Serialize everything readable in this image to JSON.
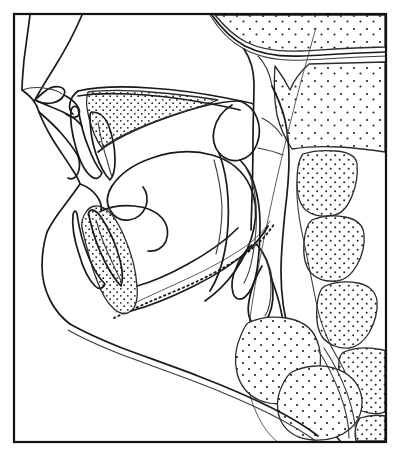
{
  "figure": {
    "title": "Lateral cephalometric tracing",
    "width_px": 397,
    "height_px": 459,
    "background_color": "#ffffff",
    "line_color": "#1a1a1a",
    "stipple_color": "#222222",
    "frame": {
      "visible": true,
      "x": 14,
      "y": 14,
      "width": 372,
      "height": 428,
      "stroke_color": "#111111",
      "stroke_width": 2.2
    },
    "labels": [],
    "annotations": [],
    "structures": [
      {
        "name": "soft-tissue-profile",
        "kind": "outline",
        "stipple": false
      },
      {
        "name": "forehead-glabella",
        "kind": "outline",
        "stipple": false
      },
      {
        "name": "nasal-dorsum",
        "kind": "outline",
        "stipple": false
      },
      {
        "name": "upper-lip",
        "kind": "outline",
        "stipple": false
      },
      {
        "name": "lower-lip",
        "kind": "outline",
        "stipple": false
      },
      {
        "name": "soft-tissue-chin",
        "kind": "outline",
        "stipple": false
      },
      {
        "name": "submental-neck-contour",
        "kind": "outline",
        "stipple": false
      },
      {
        "name": "maxilla-hard-palate",
        "kind": "bone",
        "stipple": true
      },
      {
        "name": "maxillary-central-incisor",
        "kind": "tooth",
        "stipple": false
      },
      {
        "name": "mandibular-symphysis",
        "kind": "bone",
        "stipple": true
      },
      {
        "name": "mandibular-central-incisor",
        "kind": "tooth",
        "stipple": false
      },
      {
        "name": "mandibular-body-ramus",
        "kind": "outline",
        "stipple": false
      },
      {
        "name": "tongue-dorsum",
        "kind": "soft-tissue",
        "stipple": false
      },
      {
        "name": "soft-palate-uvula",
        "kind": "soft-tissue",
        "stipple": false
      },
      {
        "name": "posterior-pharyngeal-wall",
        "kind": "soft-tissue",
        "stipple": false
      },
      {
        "name": "epiglottis",
        "kind": "soft-tissue",
        "stipple": false
      },
      {
        "name": "sphenoid-basiocciput",
        "kind": "bone",
        "stipple": true
      },
      {
        "name": "clivus-line",
        "kind": "reference-line",
        "stipple": false
      },
      {
        "name": "occipital-cranial-base",
        "kind": "bone",
        "stipple": true
      },
      {
        "name": "cervical-vertebra-c1",
        "kind": "bone",
        "stipple": true
      },
      {
        "name": "cervical-vertebra-c2",
        "kind": "bone",
        "stipple": true
      },
      {
        "name": "cervical-vertebra-c3",
        "kind": "bone",
        "stipple": true
      },
      {
        "name": "cervical-vertebra-c4",
        "kind": "bone",
        "stipple": true
      },
      {
        "name": "cervical-vertebra-c5",
        "kind": "bone",
        "stipple": true
      },
      {
        "name": "hyoid-bone",
        "kind": "bone",
        "stipple": true
      },
      {
        "name": "laryngeal-cartilage",
        "kind": "bone",
        "stipple": true
      }
    ]
  }
}
